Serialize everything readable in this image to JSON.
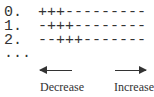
{
  "rows": [
    {
      "index": "0.",
      "pattern": "+++---------"
    },
    {
      "index": "1.",
      "pattern": "-+++--------"
    },
    {
      "index": "2.",
      "pattern": "--+++-------"
    }
  ],
  "ellipsis": "...",
  "labels": {
    "left": "Decrease",
    "right": "Increase"
  }
}
